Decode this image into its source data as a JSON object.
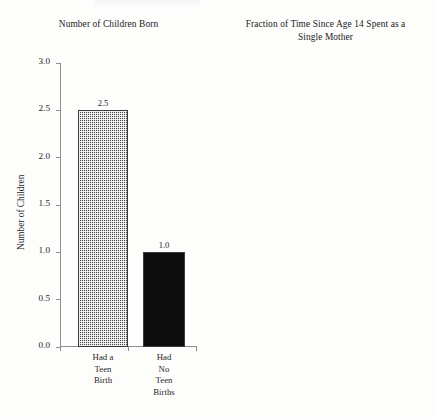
{
  "figure": {
    "width": 434,
    "height": 418,
    "background": "#fdfdfc",
    "ink_color": "#1f1f1f",
    "axis_color": "#8e8e8e"
  },
  "chart_data": [
    {
      "type": "bar",
      "title": "Number of Children Born",
      "xlabel": "",
      "ylabel": "Number of Children",
      "categories": [
        "Had a\nTeen\nBirth",
        "Had\nNo\nTeen\nBirths"
      ],
      "values": [
        2.5,
        1.0
      ],
      "value_labels": [
        "2.5",
        "1.0"
      ],
      "ylim": [
        0.0,
        3.0
      ],
      "ytick_labels": [
        "0.0",
        "0.5",
        "1.0",
        "1.5",
        "2.0",
        "2.5",
        "3.0"
      ],
      "ytick_values": [
        0.0,
        0.5,
        1.0,
        1.5,
        2.0,
        2.5,
        3.0
      ],
      "grid": false,
      "legend": "none",
      "bar_styles": [
        "crosshatch",
        "solid-black"
      ],
      "bar_colors": [
        "#4a4a4a",
        "#0c0c0c"
      ]
    },
    {
      "type": "bar",
      "title": "Fraction of Time Since Age 14 Spent as a Single Mother",
      "title_lines": [
        "Fraction of Time Since Age 14 Spent as a",
        "Single Mother"
      ],
      "xlabel": "",
      "ylabel": "Fraction of Time",
      "categories": [
        "Had a\nTeen\nBirth",
        "Had\nNo\nTeen\nBirths"
      ],
      "values": [
        0.5,
        0.21
      ],
      "value_labels": [
        "0.50",
        "0.21"
      ],
      "ylim": [
        0.0,
        0.55
      ],
      "ytick_labels": [
        "0.00",
        "0.05",
        "0.10",
        "0.15",
        "0.20",
        "0.25",
        "0.30",
        "0.35",
        "0.40",
        "0.45",
        "0.50",
        "0.55"
      ],
      "ytick_values": [
        0.0,
        0.05,
        0.1,
        0.15,
        0.2,
        0.25,
        0.3,
        0.35,
        0.4,
        0.45,
        0.5,
        0.55
      ],
      "grid": false,
      "legend": "none",
      "bar_styles": [
        "crosshatch",
        "solid-black"
      ],
      "bar_colors": [
        "#4a4a4a",
        "#0c0c0c"
      ]
    }
  ]
}
